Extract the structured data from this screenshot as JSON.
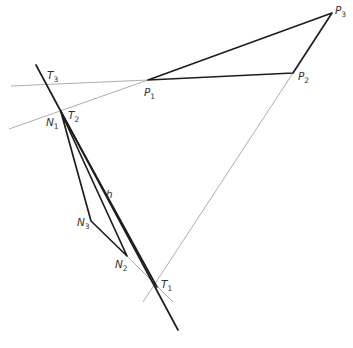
{
  "figure": {
    "type": "geometric construction diagram",
    "colors": {
      "thick_line": "#1e1e1e",
      "thin_line": "#8a8a8a",
      "label": "#333333",
      "background": "#ffffff"
    },
    "labels": {
      "P1": {
        "main": "P",
        "sub": "1"
      },
      "P2": {
        "main": "P",
        "sub": "2"
      },
      "P3": {
        "main": "P",
        "sub": "3"
      },
      "T1": {
        "main": "T",
        "sub": "1"
      },
      "T2": {
        "main": "T",
        "sub": "2"
      },
      "T3": {
        "main": "T",
        "sub": "3"
      },
      "N1": {
        "main": "N",
        "sub": "1"
      },
      "N2": {
        "main": "N",
        "sub": "2"
      },
      "N3": {
        "main": "N",
        "sub": "3"
      },
      "h": "h"
    },
    "points": {
      "P1": [
        148,
        80
      ],
      "P2": [
        293,
        73
      ],
      "P3": [
        332,
        13
      ],
      "T1": [
        157,
        287
      ],
      "T2": [
        61,
        109
      ],
      "T3": [
        46,
        84
      ],
      "N1": [
        61,
        112
      ],
      "N2": [
        127,
        256
      ],
      "N3": [
        91,
        221
      ]
    }
  }
}
